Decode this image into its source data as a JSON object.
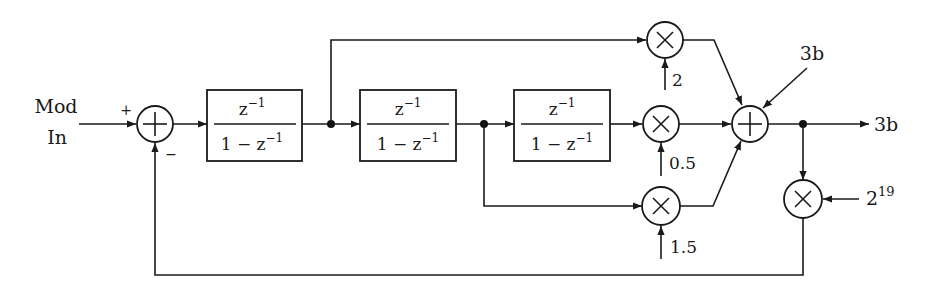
{
  "diagram": {
    "type": "signal-flow block diagram",
    "input": {
      "label_line1": "Mod",
      "label_line2": "In"
    },
    "sum1": {
      "plus_sign": "+",
      "minus_sign": "−"
    },
    "integrators": [
      {
        "numerator": "z",
        "numerator_exp": "−1",
        "denominator": "1 − z",
        "denominator_exp": "−1"
      },
      {
        "numerator": "z",
        "numerator_exp": "−1",
        "denominator": "1 − z",
        "denominator_exp": "−1"
      },
      {
        "numerator": "z",
        "numerator_exp": "−1",
        "denominator": "1 − z",
        "denominator_exp": "−1"
      }
    ],
    "gains": {
      "top": "2",
      "middle": "0.5",
      "bottom": "1.5",
      "feedback_base": "2",
      "feedback_exp": "19"
    },
    "sum2_extra_input": "3b",
    "output_label": "3b"
  },
  "colors": {
    "stroke": "#1a1a1a",
    "background": "#ffffff"
  }
}
